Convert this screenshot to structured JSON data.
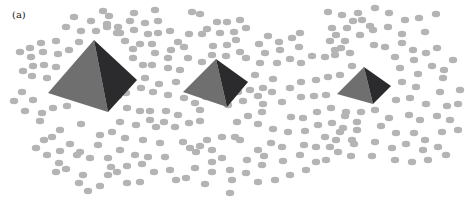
{
  "figure": {
    "panel_label": "(a)",
    "colors": {
      "background": "#ffffff",
      "dot": "#b4b4b4",
      "pyramid_light_face": "#6f6f6f",
      "pyramid_dark_face": "#2b2a2c"
    },
    "dot_size": {
      "rx": 4.2,
      "ry": 3.2
    },
    "pyramids": [
      {
        "name": "large",
        "apex": [
          94,
          40
        ],
        "left": [
          48,
          93
        ],
        "bottom": [
          108,
          112
        ],
        "right": [
          137,
          80
        ]
      },
      {
        "name": "medium",
        "apex": [
          216,
          59
        ],
        "left": [
          183,
          92
        ],
        "bottom": [
          227,
          107
        ],
        "right": [
          248,
          82
        ]
      },
      {
        "name": "small",
        "apex": [
          364,
          67
        ],
        "left": [
          337,
          94
        ],
        "bottom": [
          373,
          104
        ],
        "right": [
          391,
          86
        ]
      }
    ],
    "dots": [
      [
        74,
        17
      ],
      [
        91,
        21
      ],
      [
        66,
        27
      ],
      [
        81,
        31
      ],
      [
        96,
        31
      ],
      [
        107,
        27
      ],
      [
        117,
        33
      ],
      [
        79,
        42
      ],
      [
        125,
        41
      ],
      [
        134,
        30
      ],
      [
        30,
        48
      ],
      [
        41,
        43
      ],
      [
        56,
        41
      ],
      [
        20,
        52
      ],
      [
        31,
        57
      ],
      [
        43,
        52
      ],
      [
        58,
        54
      ],
      [
        69,
        50
      ],
      [
        23,
        71
      ],
      [
        33,
        66
      ],
      [
        44,
        65
      ],
      [
        56,
        67
      ],
      [
        32,
        76
      ],
      [
        47,
        78
      ],
      [
        22,
        92
      ],
      [
        33,
        100
      ],
      [
        14,
        101
      ],
      [
        25,
        111
      ],
      [
        42,
        113
      ],
      [
        53,
        108
      ],
      [
        67,
        106
      ],
      [
        40,
        121
      ],
      [
        81,
        124
      ],
      [
        60,
        130
      ],
      [
        100,
        135
      ],
      [
        44,
        140
      ],
      [
        52,
        137
      ],
      [
        70,
        144
      ],
      [
        80,
        152
      ],
      [
        98,
        145
      ],
      [
        36,
        148
      ],
      [
        47,
        155
      ],
      [
        60,
        151
      ],
      [
        77,
        155
      ],
      [
        59,
        163
      ],
      [
        90,
        158
      ],
      [
        56,
        172
      ],
      [
        66,
        169
      ],
      [
        83,
        175
      ],
      [
        79,
        183
      ],
      [
        100,
        186
      ],
      [
        88,
        191
      ],
      [
        103,
        11
      ],
      [
        109,
        16
      ],
      [
        134,
        13
      ],
      [
        155,
        10
      ],
      [
        130,
        21
      ],
      [
        145,
        23
      ],
      [
        158,
        21
      ],
      [
        107,
        24
      ],
      [
        118,
        27
      ],
      [
        120,
        33
      ],
      [
        148,
        34
      ],
      [
        158,
        33
      ],
      [
        170,
        31
      ],
      [
        178,
        42
      ],
      [
        189,
        34
      ],
      [
        202,
        34
      ],
      [
        140,
        44
      ],
      [
        152,
        44
      ],
      [
        171,
        50
      ],
      [
        184,
        47
      ],
      [
        133,
        49
      ],
      [
        155,
        53
      ],
      [
        168,
        58
      ],
      [
        188,
        58
      ],
      [
        133,
        58
      ],
      [
        143,
        65
      ],
      [
        152,
        65
      ],
      [
        168,
        68
      ],
      [
        180,
        70
      ],
      [
        145,
        78
      ],
      [
        159,
        84
      ],
      [
        176,
        82
      ],
      [
        141,
        88
      ],
      [
        153,
        92
      ],
      [
        168,
        95
      ],
      [
        184,
        98
      ],
      [
        126,
        93
      ],
      [
        118,
        96
      ],
      [
        127,
        108
      ],
      [
        140,
        111
      ],
      [
        150,
        111
      ],
      [
        166,
        111
      ],
      [
        178,
        115
      ],
      [
        150,
        120
      ],
      [
        164,
        122
      ],
      [
        120,
        122
      ],
      [
        136,
        125
      ],
      [
        156,
        127
      ],
      [
        175,
        127
      ],
      [
        189,
        123
      ],
      [
        200,
        121
      ],
      [
        112,
        132
      ],
      [
        125,
        138
      ],
      [
        143,
        140
      ],
      [
        160,
        143
      ],
      [
        183,
        142
      ],
      [
        200,
        146
      ],
      [
        120,
        150
      ],
      [
        135,
        155
      ],
      [
        148,
        157
      ],
      [
        165,
        157
      ],
      [
        190,
        148
      ],
      [
        108,
        158
      ],
      [
        111,
        167
      ],
      [
        127,
        166
      ],
      [
        117,
        172
      ],
      [
        142,
        164
      ],
      [
        154,
        172
      ],
      [
        170,
        170
      ],
      [
        176,
        180
      ],
      [
        140,
        182
      ],
      [
        108,
        175
      ],
      [
        127,
        183
      ],
      [
        196,
        152
      ],
      [
        207,
        140
      ],
      [
        222,
        137
      ],
      [
        212,
        150
      ],
      [
        235,
        137
      ],
      [
        240,
        140
      ],
      [
        192,
        12
      ],
      [
        200,
        14
      ],
      [
        227,
        22
      ],
      [
        240,
        20
      ],
      [
        246,
        28
      ],
      [
        217,
        22
      ],
      [
        207,
        29
      ],
      [
        220,
        33
      ],
      [
        234,
        32
      ],
      [
        236,
        40
      ],
      [
        227,
        45
      ],
      [
        213,
        46
      ],
      [
        212,
        55
      ],
      [
        202,
        62
      ],
      [
        226,
        56
      ],
      [
        240,
        52
      ],
      [
        246,
        58
      ],
      [
        259,
        44
      ],
      [
        268,
        36
      ],
      [
        279,
        42
      ],
      [
        292,
        38
      ],
      [
        300,
        33
      ],
      [
        299,
        47
      ],
      [
        280,
        50
      ],
      [
        265,
        53
      ],
      [
        260,
        63
      ],
      [
        277,
        63
      ],
      [
        290,
        59
      ],
      [
        301,
        63
      ],
      [
        312,
        56
      ],
      [
        325,
        57
      ],
      [
        335,
        50
      ],
      [
        336,
        35
      ],
      [
        345,
        41
      ],
      [
        332,
        28
      ],
      [
        353,
        21
      ],
      [
        362,
        20
      ],
      [
        370,
        26
      ],
      [
        330,
        41
      ],
      [
        341,
        48
      ],
      [
        255,
        75
      ],
      [
        250,
        90
      ],
      [
        258,
        96
      ],
      [
        272,
        92
      ],
      [
        290,
        88
      ],
      [
        301,
        82
      ],
      [
        316,
        80
      ],
      [
        328,
        77
      ],
      [
        340,
        75
      ],
      [
        352,
        66
      ],
      [
        263,
        104
      ],
      [
        282,
        102
      ],
      [
        301,
        97
      ],
      [
        314,
        96
      ],
      [
        326,
        95
      ],
      [
        331,
        108
      ],
      [
        317,
        112
      ],
      [
        303,
        118
      ],
      [
        291,
        117
      ],
      [
        262,
        112
      ],
      [
        248,
        116
      ],
      [
        237,
        122
      ],
      [
        258,
        124
      ],
      [
        273,
        129
      ],
      [
        288,
        132
      ],
      [
        305,
        131
      ],
      [
        318,
        125
      ],
      [
        332,
        123
      ],
      [
        345,
        116
      ],
      [
        357,
        122
      ],
      [
        340,
        132
      ],
      [
        325,
        137
      ],
      [
        304,
        145
      ],
      [
        282,
        147
      ],
      [
        271,
        143
      ],
      [
        258,
        150
      ],
      [
        247,
        160
      ],
      [
        264,
        156
      ],
      [
        283,
        161
      ],
      [
        300,
        155
      ],
      [
        316,
        147
      ],
      [
        330,
        147
      ],
      [
        352,
        140
      ],
      [
        246,
        173
      ],
      [
        258,
        182
      ],
      [
        262,
        165
      ],
      [
        230,
        170
      ],
      [
        232,
        180
      ],
      [
        230,
        193
      ],
      [
        212,
        162
      ],
      [
        222,
        158
      ],
      [
        195,
        168
      ],
      [
        186,
        178
      ],
      [
        205,
        184
      ],
      [
        212,
        172
      ],
      [
        228,
        105
      ],
      [
        243,
        101
      ],
      [
        238,
        92
      ],
      [
        200,
        110
      ],
      [
        206,
        97
      ],
      [
        195,
        103
      ],
      [
        263,
        88
      ],
      [
        273,
        79
      ],
      [
        328,
        12
      ],
      [
        342,
        15
      ],
      [
        358,
        13
      ],
      [
        375,
        8
      ],
      [
        389,
        13
      ],
      [
        405,
        20
      ],
      [
        419,
        18
      ],
      [
        436,
        14
      ],
      [
        347,
        28
      ],
      [
        360,
        35
      ],
      [
        373,
        30
      ],
      [
        388,
        27
      ],
      [
        402,
        34
      ],
      [
        425,
        32
      ],
      [
        374,
        45
      ],
      [
        385,
        47
      ],
      [
        402,
        43
      ],
      [
        413,
        50
      ],
      [
        426,
        53
      ],
      [
        437,
        48
      ],
      [
        335,
        55
      ],
      [
        350,
        53
      ],
      [
        395,
        57
      ],
      [
        414,
        60
      ],
      [
        432,
        66
      ],
      [
        444,
        70
      ],
      [
        453,
        60
      ],
      [
        400,
        68
      ],
      [
        418,
        74
      ],
      [
        443,
        78
      ],
      [
        402,
        82
      ],
      [
        416,
        87
      ],
      [
        440,
        92
      ],
      [
        460,
        90
      ],
      [
        396,
        100
      ],
      [
        410,
        98
      ],
      [
        426,
        104
      ],
      [
        447,
        106
      ],
      [
        458,
        104
      ],
      [
        346,
        112
      ],
      [
        361,
        112
      ],
      [
        375,
        110
      ],
      [
        389,
        118
      ],
      [
        409,
        115
      ],
      [
        420,
        120
      ],
      [
        437,
        116
      ],
      [
        450,
        120
      ],
      [
        343,
        128
      ],
      [
        357,
        130
      ],
      [
        381,
        126
      ],
      [
        396,
        133
      ],
      [
        414,
        133
      ],
      [
        425,
        140
      ],
      [
        442,
        132
      ],
      [
        458,
        130
      ],
      [
        336,
        140
      ],
      [
        354,
        144
      ],
      [
        375,
        142
      ],
      [
        392,
        148
      ],
      [
        406,
        144
      ],
      [
        423,
        150
      ],
      [
        438,
        147
      ],
      [
        351,
        156
      ],
      [
        372,
        156
      ],
      [
        395,
        160
      ],
      [
        412,
        162
      ],
      [
        428,
        160
      ],
      [
        446,
        155
      ],
      [
        326,
        160
      ],
      [
        338,
        152
      ],
      [
        316,
        162
      ],
      [
        306,
        170
      ],
      [
        290,
        175
      ],
      [
        275,
        180
      ]
    ]
  }
}
